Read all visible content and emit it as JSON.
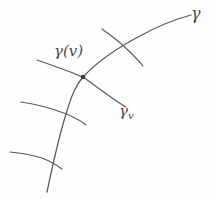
{
  "figure": {
    "kind": "geometry-diagram",
    "title_text": "",
    "background_color": "#fefefe",
    "stroke_color": "#585858",
    "label_color": "#4a4a4a",
    "width": 216,
    "height": 199,
    "labels": {
      "main_curve": "γ",
      "point": "γ(v)",
      "branch_curve_base": "γ",
      "branch_curve_subscript": "v"
    },
    "marked_point": {
      "x": 83,
      "y": 77,
      "radius": 2.3
    },
    "curves": [
      {
        "name": "main-geodesic-gamma",
        "d": "M 47 192 C 52 168 58 140 66 114 C 72 94 76 85 83 77 C 97 62 117 48 140 36 C 158 26 176 19 191 15"
      },
      {
        "name": "branch-geodesic-gamma-v",
        "d": "M 83 77 C 93 84 106 94 118 102 C 121 104 124 106 126 107"
      },
      {
        "name": "transversal-upper-left",
        "d": "M 37 60 C 49 64 62 69 73 73 C 77 75 80 76 83 77"
      },
      {
        "name": "transversal-upper-right",
        "d": "M 102 29 C 112 36 122 44 130 52 C 136 58 140 62 143 66"
      },
      {
        "name": "transversal-middle-left",
        "d": "M 21 102 C 34 104 47 107 58 111 C 70 115 80 120 86 125"
      },
      {
        "name": "transversal-lower-left",
        "d": "M 10 152 C 21 153 32 155 42 158 C 52 162 58 166 62 169"
      }
    ]
  }
}
